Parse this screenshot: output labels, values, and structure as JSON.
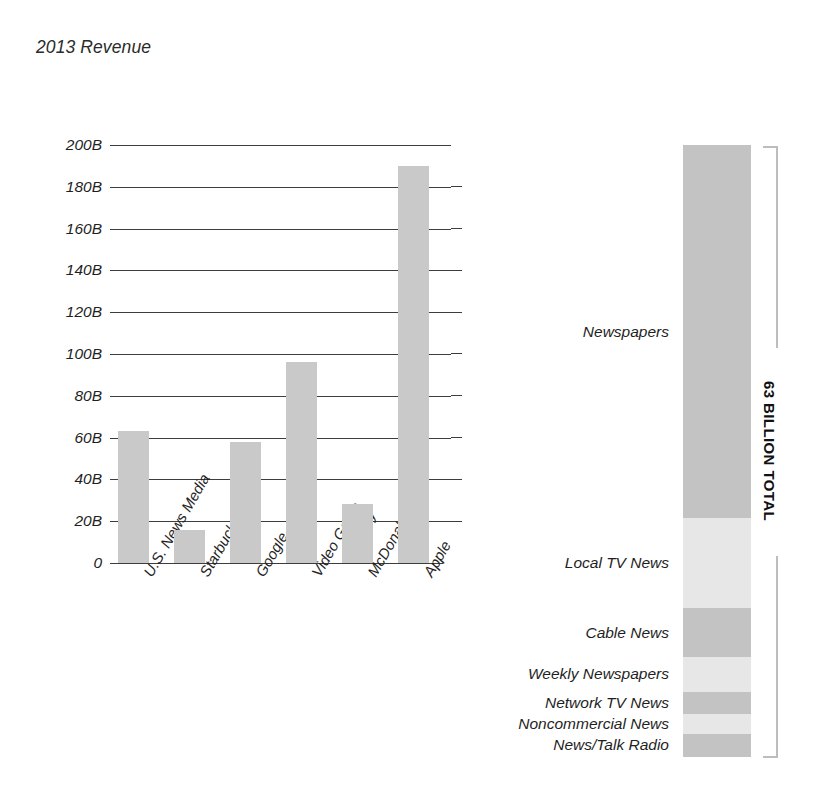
{
  "left_panel": {
    "title": "2013 Revenue"
  },
  "right_panel": {
    "title": "Where that news revenue\ncomes from",
    "total_caption": "63 BILLION TOTAL"
  },
  "colors": {
    "bar_fill": "#c9c9c9",
    "segment_dark": "#c3c3c3",
    "segment_light": "#e7e7e7",
    "axis": "#3d3d3d",
    "bracket": "#bdbdbd",
    "text": "#1f1f1f",
    "background": "#ffffff"
  },
  "chart_data": [
    {
      "type": "bar",
      "title": "2013 Revenue",
      "xlabel": "",
      "ylabel": "",
      "ylim": [
        0,
        200
      ],
      "unit": "billion USD",
      "grid": true,
      "legend": "none",
      "ticks": [
        "200B",
        "180B",
        "160B",
        "140B",
        "120B",
        "100B",
        "80B",
        "60B",
        "40B",
        "20B",
        "0"
      ],
      "tick_values": [
        200,
        180,
        160,
        140,
        120,
        100,
        80,
        60,
        40,
        20,
        0
      ],
      "categories": [
        "U.S. News Media",
        "Starbucks",
        "Google",
        "Video Game\nIndustry",
        "McDonald's",
        "Apple"
      ],
      "values": [
        63,
        16,
        58,
        96,
        28,
        190
      ]
    },
    {
      "type": "bar",
      "subtype": "stacked",
      "title": "Where that news revenue comes from",
      "orientation": "vertical",
      "total": 63,
      "total_label": "63 BILLION TOTAL",
      "unit": "billion USD",
      "grid": false,
      "legend": "inline-labels",
      "categories": [
        "Newspapers",
        "Local TV News",
        "Cable News",
        "Weekly Newspapers",
        "Network TV News",
        "Noncommercial News",
        "News/Talk Radio"
      ],
      "values": [
        38.4,
        9.3,
        5.0,
        3.6,
        2.3,
        2.0,
        2.4
      ],
      "shades": [
        "dark",
        "light",
        "dark",
        "light",
        "dark",
        "light",
        "dark"
      ]
    }
  ]
}
